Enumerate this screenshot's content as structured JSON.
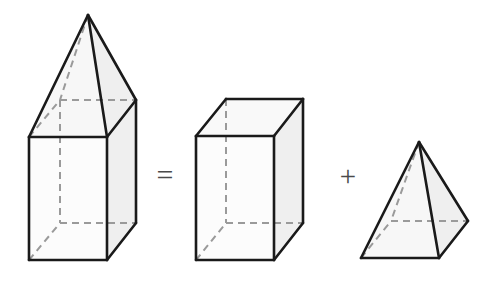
{
  "figure": {
    "background_color": "#ffffff",
    "stroke_color": "#1a1a1a",
    "hidden_edge_color": "#9a9a9a",
    "face_front_color": "#fcfcfc",
    "face_side_color": "#efefef",
    "face_top_color": "#f7f7f7",
    "stroke_width": 2.6,
    "hidden_stroke_width": 2.0,
    "hidden_dash": "7,5"
  },
  "operators": {
    "equals": "=",
    "plus": "+"
  },
  "shapes": [
    {
      "id": "composite-prism-with-pyramid",
      "name": "rectangular prism topped by a pyramid",
      "position": "left",
      "parts": [
        "rectangular-prism",
        "pyramid-cap"
      ],
      "vertices": {
        "apex": [
          88,
          15
        ],
        "front_top_left": [
          29,
          137
        ],
        "front_top_right": [
          107,
          137
        ],
        "back_top_left": [
          60,
          100
        ],
        "back_top_right": [
          136,
          100
        ],
        "front_bottom_left": [
          29,
          260
        ],
        "front_bottom_right": [
          107,
          260
        ],
        "back_bottom_left": [
          60,
          223
        ],
        "back_bottom_right": [
          136,
          223
        ]
      }
    },
    {
      "id": "rectangular-prism",
      "name": "rectangular prism (cuboid)",
      "position": "middle",
      "vertices": {
        "front_top_left": [
          196,
          136
        ],
        "front_top_right": [
          274,
          136
        ],
        "back_top_left": [
          226,
          99
        ],
        "back_top_right": [
          303,
          99
        ],
        "front_bottom_left": [
          196,
          260
        ],
        "front_bottom_right": [
          274,
          260
        ],
        "back_bottom_left": [
          226,
          223
        ],
        "back_bottom_right": [
          303,
          223
        ]
      }
    },
    {
      "id": "square-pyramid",
      "name": "square pyramid",
      "position": "right",
      "vertices": {
        "apex": [
          419,
          142
        ],
        "front_left": [
          361,
          258
        ],
        "front_right": [
          439,
          258
        ],
        "back_left": [
          391,
          221
        ],
        "back_right": [
          468,
          221
        ]
      }
    }
  ],
  "equation": {
    "statement": "prism with pyramid top = prism + pyramid",
    "left_term": "composite-prism-with-pyramid",
    "right_term_1": "rectangular-prism",
    "right_term_2": "square-pyramid"
  }
}
